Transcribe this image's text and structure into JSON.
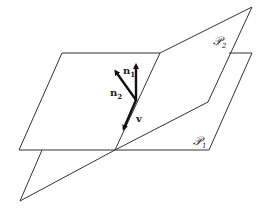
{
  "diagram": {
    "title": "",
    "planes": [
      {
        "id": "P1",
        "label": "𝒫",
        "subscript": "1",
        "description": "horizontal plane"
      },
      {
        "id": "P2",
        "label": "𝒫",
        "subscript": "2",
        "description": "tilted plane intersecting P1"
      }
    ],
    "vectors": [
      {
        "id": "n1",
        "label": "n",
        "subscript": "1",
        "description": "normal to plane 1"
      },
      {
        "id": "n2",
        "label": "n",
        "subscript": "2",
        "description": "normal to plane 2"
      },
      {
        "id": "v",
        "label": "v",
        "subscript": "",
        "description": "direction of line of intersection"
      }
    ],
    "colors": {
      "stroke": "#333333",
      "background": "#ffffff"
    }
  }
}
